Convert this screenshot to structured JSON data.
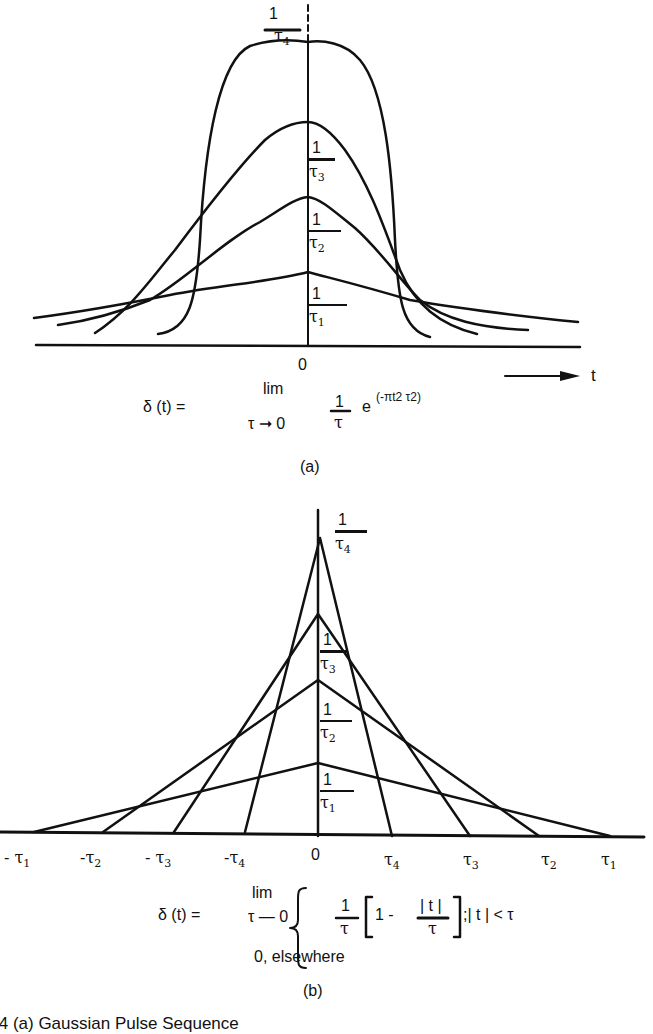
{
  "figure_a": {
    "panel_label": "(a)",
    "axis_origin_label": "0",
    "axis_arrow_label": "t",
    "peak_labels": [
      {
        "num": "1",
        "den": "τ",
        "sub": "4"
      },
      {
        "num": "1",
        "den": "τ",
        "sub": "3"
      },
      {
        "num": "1",
        "den": "τ",
        "sub": "2"
      },
      {
        "num": "1",
        "den": "τ",
        "sub": "1"
      }
    ],
    "equation": {
      "lhs": "δ (t) =",
      "lim": "lim",
      "lim_sub": "τ ➞ 0",
      "frac_num": "1",
      "frac_den": "τ",
      "exp_base": "e",
      "exponent": "(-πt2  τ2)"
    }
  },
  "figure_b": {
    "panel_label": "(b)",
    "peak_labels": [
      {
        "num": "1",
        "den": "τ",
        "sub": "4"
      },
      {
        "num": "1",
        "den": "τ",
        "sub": "3"
      },
      {
        "num": "1",
        "den": "τ",
        "sub": "2"
      },
      {
        "num": "1",
        "den": "τ",
        "sub": "1"
      }
    ],
    "x_ticks": [
      {
        "sign": "-",
        "sym": "τ",
        "sub": "1"
      },
      {
        "sign": "-",
        "sym": "τ",
        "sub": "2"
      },
      {
        "sign": "-",
        "sym": "τ",
        "sub": "3"
      },
      {
        "sign": "-",
        "sym": "τ",
        "sub": "4"
      },
      {
        "sign": "",
        "sym": "0",
        "sub": ""
      },
      {
        "sign": "",
        "sym": "τ",
        "sub": "4"
      },
      {
        "sign": "",
        "sym": "τ",
        "sub": "3"
      },
      {
        "sign": "",
        "sym": "τ",
        "sub": "2"
      },
      {
        "sign": "",
        "sym": "τ",
        "sub": "1"
      }
    ],
    "equation": {
      "lhs": "δ (t) =",
      "lim": "lim",
      "lim_sub": "τ — 0",
      "frac_num": "1",
      "frac_den": "τ",
      "bracket_open": "[",
      "one_minus": "1 -",
      "inner_num": "| t |",
      "inner_den": "τ",
      "bracket_close": "]",
      "condition": ";| t | < τ",
      "otherwise": "0, elsewhere"
    }
  },
  "caption_partial": ".4   (a) Gaussian Pulse Sequence"
}
